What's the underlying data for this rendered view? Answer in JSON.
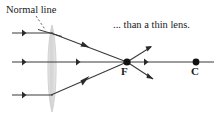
{
  "figure": {
    "type": "optics-ray-diagram",
    "width": 218,
    "height": 115,
    "background_color": "#ffffff",
    "ray_color": "#3a3a3a",
    "lens_fill_color": "#dcdcdc",
    "lens_edge_color": "#c2c2c2",
    "point_color": "#111111",
    "normal_line_color": "#555555",
    "labels": {
      "normal_line": "Normal line",
      "caption": "... than a thin lens.",
      "focal_point": "F",
      "center_point": "C"
    },
    "axis": {
      "y": 62,
      "x_start": 12,
      "x_end": 214
    },
    "lens": {
      "center_x": 52,
      "top_y": 25,
      "bottom_y": 112,
      "half_width": 5.5
    },
    "points": [
      {
        "name": "focal-point",
        "label": "F",
        "x": 127,
        "y": 62,
        "radius": 3.6
      },
      {
        "name": "center-point",
        "label": "C",
        "x": 196,
        "y": 62,
        "radius": 3.4
      }
    ],
    "incoming_rays": [
      {
        "name": "upper-incoming-ray",
        "y": 33,
        "x_start": 12,
        "x_end": 52,
        "arrow_x": 24
      },
      {
        "name": "axial-incoming-ray",
        "y": 62,
        "x_start": 12,
        "x_end": 52,
        "arrow_x": 24
      },
      {
        "name": "lower-incoming-ray",
        "y": 95,
        "x_start": 12,
        "x_end": 52,
        "arrow_x": 24
      }
    ],
    "refracted_rays": [
      {
        "name": "upper-refracted-ray",
        "x1": 52,
        "y1": 33,
        "x2": 127,
        "y2": 62,
        "arrow_t": 0.45
      },
      {
        "name": "axial-refracted-ray",
        "x1": 52,
        "y1": 62,
        "x2": 127,
        "y2": 62,
        "arrow_t": 0.6
      },
      {
        "name": "lower-refracted-ray",
        "x1": 52,
        "y1": 95,
        "x2": 127,
        "y2": 62,
        "arrow_t": 0.45
      }
    ],
    "diverging_rays": [
      {
        "name": "upper-diverging-ray",
        "x1": 127,
        "y1": 62,
        "x2": 150,
        "y2": 47
      },
      {
        "name": "axial-diverging-ray",
        "x1": 127,
        "y1": 62,
        "x2": 214,
        "y2": 62,
        "arrow_x": 148
      },
      {
        "name": "lower-diverging-ray",
        "x1": 127,
        "y1": 62,
        "x2": 152,
        "y2": 78
      }
    ],
    "normal_indicator": {
      "dashed_leader": {
        "x1": 36,
        "y1": 17,
        "x2": 46,
        "y2": 31
      },
      "normal_segment": {
        "x1": 39,
        "y1": 30,
        "x2": 62,
        "y2": 36
      }
    }
  }
}
